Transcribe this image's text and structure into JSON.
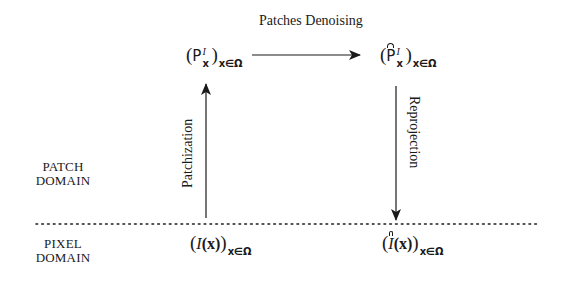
{
  "diagram": {
    "type": "commutative-flow",
    "regions": {
      "patch_domain": {
        "label_line1": "PATCH",
        "label_line2": "DOMAIN"
      },
      "pixel_domain": {
        "label_line1": "PIXEL",
        "label_line2": "DOMAIN"
      },
      "separator": "dotted-horizontal-line"
    },
    "nodes": {
      "patches": {
        "base": "P",
        "sup": "I",
        "sub": "x",
        "index": "x∈Ω",
        "hat": false
      },
      "denoised_patches": {
        "base": "P",
        "sup": "I",
        "sub": "x",
        "index": "x∈Ω",
        "hat": true
      },
      "image": {
        "base": "I",
        "arg": "(x)",
        "index": "x∈Ω",
        "hat": false
      },
      "denoised_image": {
        "base": "I",
        "arg": "(x)",
        "index": "x∈Ω",
        "hat": true
      }
    },
    "edges": {
      "patchization": {
        "label": "Patchization",
        "from": "image",
        "to": "patches",
        "direction": "up"
      },
      "patches_denoising": {
        "label": "Patches Denoising",
        "from": "patches",
        "to": "denoised_patches",
        "direction": "right"
      },
      "reprojection": {
        "label": "Reprojection",
        "from": "denoised_patches",
        "to": "denoised_image",
        "direction": "down"
      }
    },
    "colors": {
      "stroke": "#1a1a1a",
      "background": "#ffffff"
    }
  }
}
